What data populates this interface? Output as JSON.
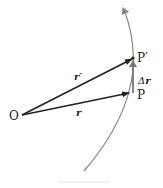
{
  "diagram": {
    "type": "position-vector-displacement",
    "points": {
      "origin": {
        "label": "O"
      },
      "p": {
        "label": "P"
      },
      "p_prime": {
        "label": "P′"
      }
    },
    "vectors": {
      "r": {
        "label": "r"
      },
      "r_prime": {
        "label": "r′"
      },
      "delta_r": {
        "label_prefix": "Δ",
        "label": "r"
      }
    },
    "colors": {
      "vector": "#222222",
      "trajectory": "#888888",
      "delta_arrow": "#777777"
    }
  }
}
